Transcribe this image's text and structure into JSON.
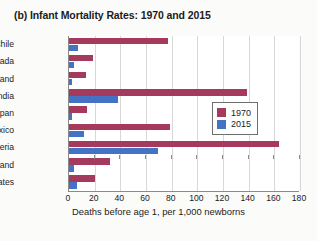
{
  "figure": {
    "title": "(b) Infant Mortality Rates: 1970 and 2015"
  },
  "legend": {
    "position": "right-middle",
    "entries": [
      {
        "label": "1970",
        "color": "#a53a5c"
      },
      {
        "label": "2015",
        "color": "#4472c4"
      }
    ]
  },
  "chart_data": {
    "type": "bar",
    "orientation": "horizontal",
    "title": "(b) Infant Mortality Rates: 1970 and 2015",
    "xlabel": "Deaths before age 1, per 1,000 newborns",
    "ylabel": "",
    "categories": [
      "Chile",
      "Canada",
      "Finland",
      "India",
      "Japan",
      "Mexico",
      "Nigeria",
      "Poland",
      "United States"
    ],
    "series": [
      {
        "name": "1970",
        "color": "#a53a5c",
        "values": [
          77,
          19,
          13,
          139,
          14,
          79,
          164,
          32,
          20
        ]
      },
      {
        "name": "2015",
        "color": "#4472c4",
        "values": [
          7,
          4,
          2,
          38,
          2,
          12,
          69,
          4,
          6
        ]
      }
    ],
    "xlim": [
      0,
      180
    ],
    "xticks": [
      0,
      20,
      40,
      60,
      80,
      100,
      120,
      140,
      160,
      180
    ],
    "xtick_labels": [
      "0",
      "20",
      "40",
      "60",
      "80",
      "100",
      "120",
      "140",
      "160",
      "180"
    ],
    "grid": "vertical"
  }
}
